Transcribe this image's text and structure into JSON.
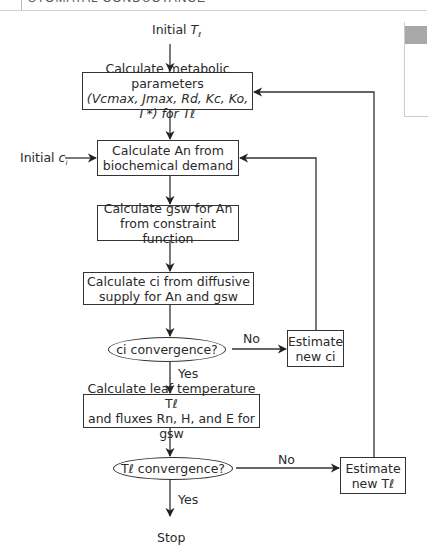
{
  "header": {
    "running_title": "STOMATAL CONDUCTANCE"
  },
  "flowchart": {
    "start": {
      "text": "Initial ",
      "var": "T",
      "sub": "ℓ"
    },
    "initial_ci": {
      "text": "Initial ",
      "var": "c",
      "sub": "i"
    },
    "box_metabolic": {
      "line1": "Calculate metabolic parameters",
      "line2": "(Vcmax, Jmax, Rd, Kc, Ko, Γ*) for Tℓ"
    },
    "box_an": {
      "line1": "Calculate An from",
      "line2": "biochemical demand"
    },
    "box_gsw": {
      "line1": "Calculate gsw for An",
      "line2": "from constraint function"
    },
    "box_ci": {
      "line1": "Calculate ci from diffusive",
      "line2": "supply for An and gsw"
    },
    "decision_ci": {
      "text": "ci convergence?"
    },
    "estimate_ci": {
      "line1": "Estimate",
      "line2": "new ci"
    },
    "box_leaf": {
      "line1": "Calculate leaf temperature Tℓ",
      "line2": "and fluxes Rn, H, and E for gsw"
    },
    "decision_t": {
      "text": "Tℓ convergence?"
    },
    "estimate_t": {
      "line1": "Estimate",
      "line2": "new Tℓ"
    },
    "labels": {
      "yes": "Yes",
      "no": "No"
    },
    "stop": "Stop"
  }
}
